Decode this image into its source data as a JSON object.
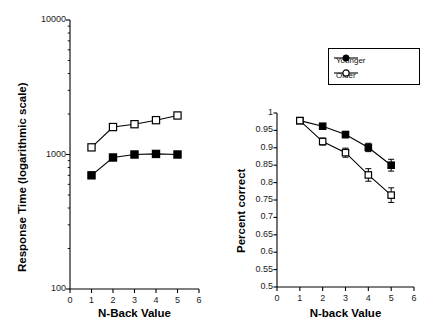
{
  "figure": {
    "background": "#ffffff",
    "series_colors": {
      "younger": "#000000",
      "older": "#000000"
    }
  },
  "legend": {
    "position": "top-right",
    "entries": [
      {
        "label": "Younger",
        "marker": "filled-circle-icon"
      },
      {
        "label": "Older",
        "marker": "open-circle-icon"
      }
    ]
  },
  "chart_data": [
    {
      "type": "line",
      "panel": "left",
      "title": "",
      "xlabel": "N-Back Value",
      "ylabel": "Response Time (logarithmic scale)",
      "yscale": "log",
      "xlim": [
        0,
        6
      ],
      "ylim": [
        100,
        10000
      ],
      "grid": false,
      "legend": "none",
      "marker_shape": "square",
      "x": [
        1,
        2,
        3,
        4,
        5
      ],
      "xticks": [
        "0",
        "1",
        "2",
        "3",
        "4",
        "5",
        "6"
      ],
      "yticks": [
        "100",
        "1000",
        "10000"
      ],
      "series": [
        {
          "name": "Younger",
          "marker": "filled-square",
          "values": [
            700,
            950,
            1000,
            1010,
            1000
          ]
        },
        {
          "name": "Older",
          "marker": "open-square",
          "values": [
            1130,
            1600,
            1680,
            1800,
            1950
          ]
        }
      ]
    },
    {
      "type": "line",
      "panel": "right",
      "title": "",
      "xlabel": "N-back Value",
      "ylabel": "Percent correct",
      "yscale": "linear",
      "xlim": [
        0,
        6
      ],
      "ylim": [
        0.5,
        1
      ],
      "grid": false,
      "legend": "top-right",
      "marker_shape": "square",
      "x": [
        1,
        2,
        3,
        4,
        5
      ],
      "xticks": [
        "0",
        "1",
        "2",
        "3",
        "4",
        "5",
        "6"
      ],
      "yticks": [
        "0.5",
        "0.55",
        "0.6",
        "0.65",
        "0.7",
        "0.75",
        "0.8",
        "0.85",
        "0.9",
        "0.95",
        "1"
      ],
      "series": [
        {
          "name": "Younger",
          "marker": "filled-square",
          "values": [
            0.978,
            0.962,
            0.938,
            0.901,
            0.85
          ],
          "errors": [
            0.004,
            0.007,
            0.009,
            0.012,
            0.017
          ]
        },
        {
          "name": "Older",
          "marker": "open-square",
          "values": [
            0.978,
            0.918,
            0.886,
            0.822,
            0.764
          ],
          "errors": [
            0.005,
            0.01,
            0.013,
            0.018,
            0.021
          ]
        }
      ]
    }
  ]
}
